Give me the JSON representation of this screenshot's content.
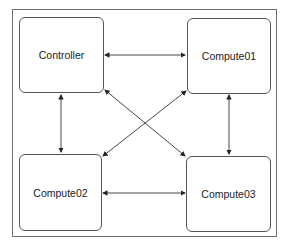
{
  "diagram": {
    "nodes": [
      {
        "id": "controller",
        "label": "Controller"
      },
      {
        "id": "compute01",
        "label": "Compute01"
      },
      {
        "id": "compute02",
        "label": "Compute02"
      },
      {
        "id": "compute03",
        "label": "Compute03"
      }
    ],
    "edges": [
      {
        "from": "controller",
        "to": "compute01",
        "bidirectional": true
      },
      {
        "from": "controller",
        "to": "compute02",
        "bidirectional": true
      },
      {
        "from": "controller",
        "to": "compute03",
        "bidirectional": true
      },
      {
        "from": "compute01",
        "to": "compute02",
        "bidirectional": true
      },
      {
        "from": "compute01",
        "to": "compute03",
        "bidirectional": true
      },
      {
        "from": "compute02",
        "to": "compute03",
        "bidirectional": true
      }
    ],
    "colors": {
      "stroke": "#555555",
      "frame": "#6e6e6e"
    }
  }
}
